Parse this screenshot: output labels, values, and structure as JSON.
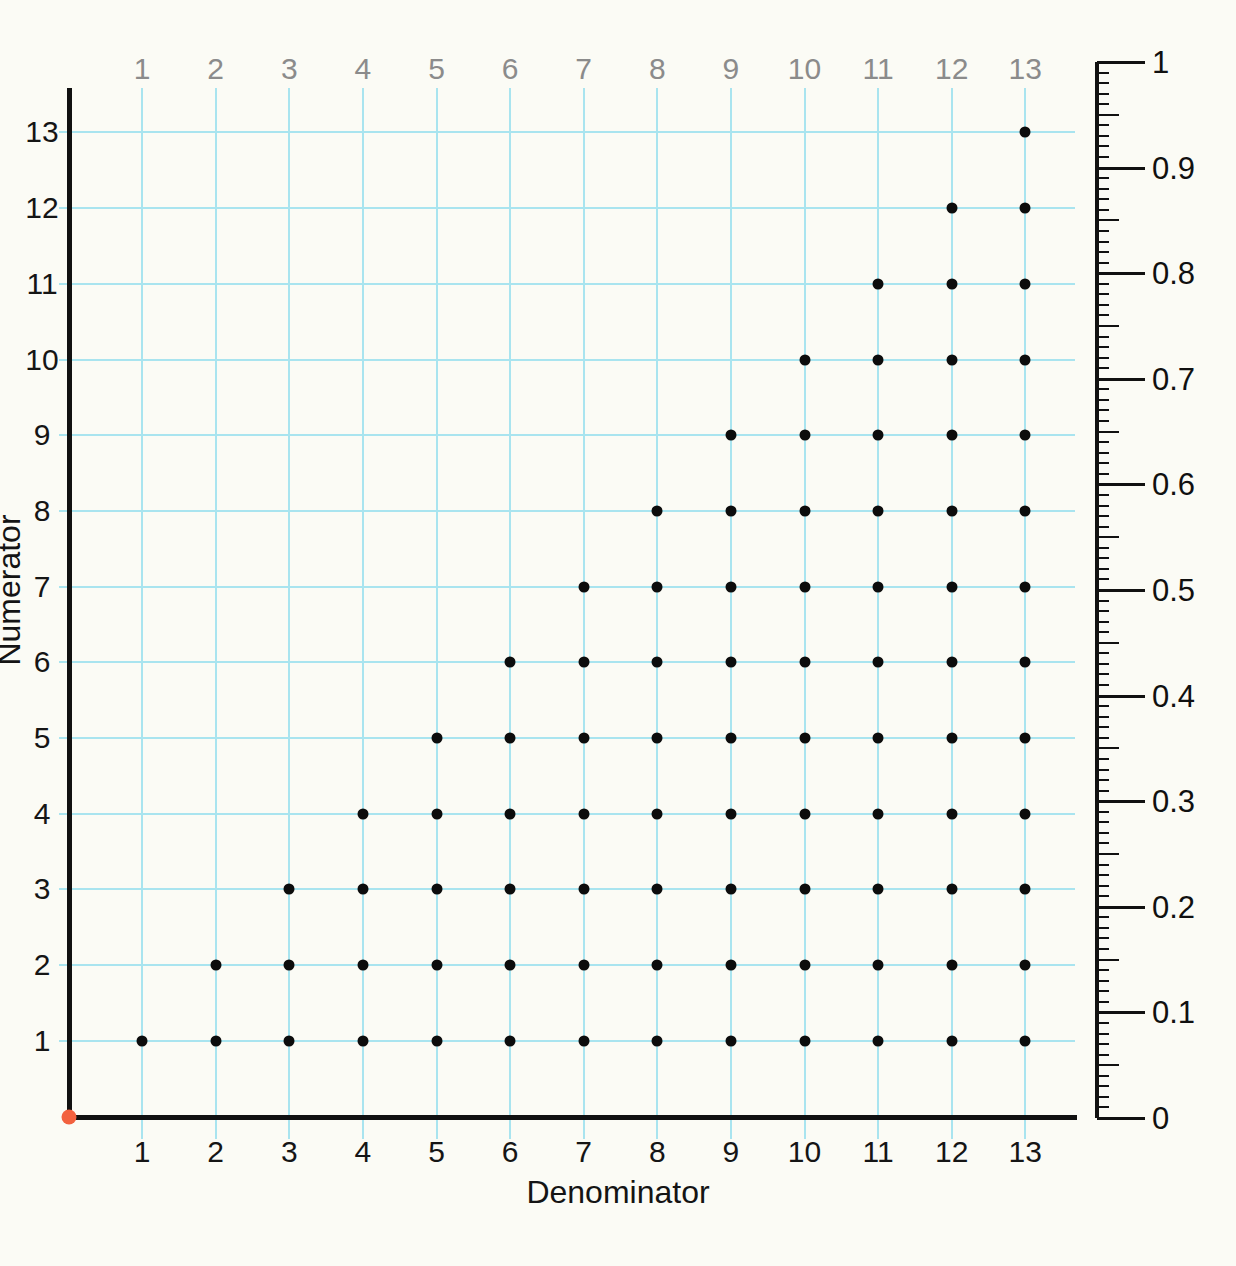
{
  "chart_data": {
    "type": "scatter",
    "title": "",
    "xlabel": "Denominator",
    "ylabel": "Numerator",
    "xlim": [
      0,
      13.7
    ],
    "ylim": [
      0,
      14.4
    ],
    "grid": true,
    "legend": null,
    "x_ticks_bottom": [
      "1",
      "2",
      "3",
      "4",
      "5",
      "6",
      "7",
      "8",
      "9",
      "10",
      "11",
      "12",
      "13"
    ],
    "x_ticks_top": [
      "1",
      "2",
      "3",
      "4",
      "5",
      "6",
      "7",
      "8",
      "9",
      "10",
      "11",
      "12",
      "13"
    ],
    "y_ticks_left": [
      "1",
      "2",
      "3",
      "4",
      "5",
      "6",
      "7",
      "8",
      "9",
      "10",
      "11",
      "12",
      "13"
    ],
    "x_tick_values": [
      1,
      2,
      3,
      4,
      5,
      6,
      7,
      8,
      9,
      10,
      11,
      12,
      13
    ],
    "y_tick_values": [
      1,
      2,
      3,
      4,
      5,
      6,
      7,
      8,
      9,
      10,
      11,
      12,
      13
    ],
    "secondary_axis": {
      "position": "right",
      "label": "",
      "range": [
        0,
        1
      ],
      "major_step": 0.1,
      "medium_step": 0.05,
      "minor_step": 0.01,
      "tick_labels": [
        "0",
        "0.1",
        "0.2",
        "0.3",
        "0.4",
        "0.5",
        "0.6",
        "0.7",
        "0.8",
        "0.9",
        "1"
      ],
      "tick_values": [
        0,
        0.1,
        0.2,
        0.3,
        0.4,
        0.5,
        0.6,
        0.7,
        0.8,
        0.9,
        1
      ]
    },
    "origin_marker": {
      "x": 0,
      "y": 0,
      "color": "#f2613f",
      "label": ""
    },
    "series": [
      {
        "name": "fractions",
        "marker": "circle",
        "color": "#0c0c0c",
        "points": [
          [
            1,
            1
          ],
          [
            2,
            1
          ],
          [
            2,
            2
          ],
          [
            3,
            1
          ],
          [
            3,
            2
          ],
          [
            3,
            3
          ],
          [
            4,
            1
          ],
          [
            4,
            2
          ],
          [
            4,
            3
          ],
          [
            4,
            4
          ],
          [
            5,
            1
          ],
          [
            5,
            2
          ],
          [
            5,
            3
          ],
          [
            5,
            4
          ],
          [
            5,
            5
          ],
          [
            6,
            1
          ],
          [
            6,
            2
          ],
          [
            6,
            3
          ],
          [
            6,
            4
          ],
          [
            6,
            5
          ],
          [
            6,
            6
          ],
          [
            7,
            1
          ],
          [
            7,
            2
          ],
          [
            7,
            3
          ],
          [
            7,
            4
          ],
          [
            7,
            5
          ],
          [
            7,
            6
          ],
          [
            7,
            7
          ],
          [
            8,
            1
          ],
          [
            8,
            2
          ],
          [
            8,
            3
          ],
          [
            8,
            4
          ],
          [
            8,
            5
          ],
          [
            8,
            6
          ],
          [
            8,
            7
          ],
          [
            8,
            8
          ],
          [
            9,
            1
          ],
          [
            9,
            2
          ],
          [
            9,
            3
          ],
          [
            9,
            4
          ],
          [
            9,
            5
          ],
          [
            9,
            6
          ],
          [
            9,
            7
          ],
          [
            9,
            8
          ],
          [
            9,
            9
          ],
          [
            10,
            1
          ],
          [
            10,
            2
          ],
          [
            10,
            3
          ],
          [
            10,
            4
          ],
          [
            10,
            5
          ],
          [
            10,
            6
          ],
          [
            10,
            7
          ],
          [
            10,
            8
          ],
          [
            10,
            9
          ],
          [
            10,
            10
          ],
          [
            11,
            1
          ],
          [
            11,
            2
          ],
          [
            11,
            3
          ],
          [
            11,
            4
          ],
          [
            11,
            5
          ],
          [
            11,
            6
          ],
          [
            11,
            7
          ],
          [
            11,
            8
          ],
          [
            11,
            9
          ],
          [
            11,
            10
          ],
          [
            11,
            11
          ],
          [
            12,
            1
          ],
          [
            12,
            2
          ],
          [
            12,
            3
          ],
          [
            12,
            4
          ],
          [
            12,
            5
          ],
          [
            12,
            6
          ],
          [
            12,
            7
          ],
          [
            12,
            8
          ],
          [
            12,
            9
          ],
          [
            12,
            10
          ],
          [
            12,
            11
          ],
          [
            12,
            12
          ],
          [
            13,
            1
          ],
          [
            13,
            2
          ],
          [
            13,
            3
          ],
          [
            13,
            4
          ],
          [
            13,
            5
          ],
          [
            13,
            6
          ],
          [
            13,
            7
          ],
          [
            13,
            8
          ],
          [
            13,
            9
          ],
          [
            13,
            10
          ],
          [
            13,
            11
          ],
          [
            13,
            12
          ],
          [
            13,
            13
          ]
        ]
      }
    ]
  },
  "colors": {
    "background": "#fbfbf5",
    "gridline": "#a9e4ef",
    "axis": "#111111",
    "dot": "#0c0c0c",
    "origin": "#f2613f",
    "top_tick_label": "#8b8b8b",
    "tick_label": "#151515"
  }
}
